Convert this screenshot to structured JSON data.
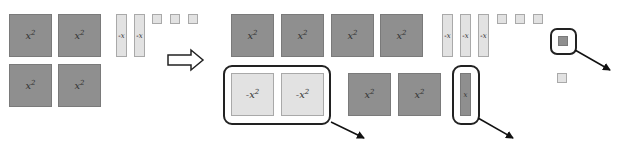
{
  "diagram": {
    "colors": {
      "positive_tile": "#8f8f8f",
      "negative_tile": "#e2e2e2",
      "outline": "#222222"
    },
    "left_panel": {
      "big_tiles": [
        {
          "base": "x",
          "exp": "2",
          "sign": "+"
        },
        {
          "base": "x",
          "exp": "2",
          "sign": "+"
        },
        {
          "base": "x",
          "exp": "2",
          "sign": "+"
        },
        {
          "base": "x",
          "exp": "2",
          "sign": "+"
        }
      ],
      "bars": [
        {
          "label": "-x",
          "sign": "-"
        },
        {
          "label": "-x",
          "sign": "-"
        }
      ],
      "units": [
        {
          "sign": "-"
        },
        {
          "sign": "-"
        },
        {
          "sign": "-"
        }
      ]
    },
    "transform_arrow": "right-arrow",
    "right_panel": {
      "top_big_tiles": [
        {
          "base": "x",
          "exp": "2",
          "sign": "+"
        },
        {
          "base": "x",
          "exp": "2",
          "sign": "+"
        },
        {
          "base": "x",
          "exp": "2",
          "sign": "+"
        },
        {
          "base": "x",
          "exp": "2",
          "sign": "+"
        }
      ],
      "top_bars": [
        {
          "label": "-x",
          "sign": "-"
        },
        {
          "label": "-x",
          "sign": "-"
        },
        {
          "label": "-x",
          "sign": "-"
        }
      ],
      "top_units": [
        {
          "sign": "-"
        },
        {
          "sign": "-"
        },
        {
          "sign": "-"
        }
      ],
      "removed_unit": {
        "sign": "+"
      },
      "extra_unit": {
        "sign": "-"
      },
      "removed_neg_big_tiles": [
        {
          "base": "-x",
          "exp": "2",
          "sign": "-"
        },
        {
          "base": "-x",
          "exp": "2",
          "sign": "-"
        }
      ],
      "bottom_big_tiles": [
        {
          "base": "x",
          "exp": "2",
          "sign": "+"
        },
        {
          "base": "x",
          "exp": "2",
          "sign": "+"
        }
      ],
      "removed_bar": {
        "label": "x",
        "sign": "+"
      }
    }
  }
}
